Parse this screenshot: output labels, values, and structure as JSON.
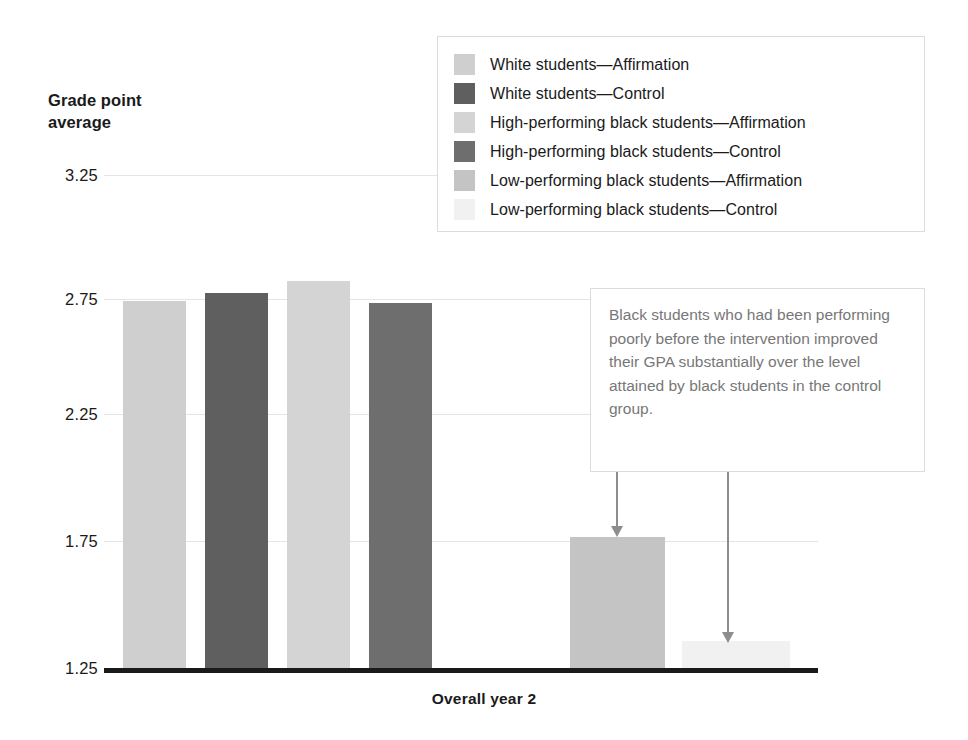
{
  "chart_data": {
    "type": "bar",
    "title": "",
    "ylabel": "Grade point average",
    "xlabel": "Overall year 2",
    "ylim": [
      1.25,
      3.25
    ],
    "yticks": [
      "1.25",
      "1.75",
      "2.25",
      "2.75",
      "3.25"
    ],
    "ytick_values": [
      1.25,
      1.75,
      2.25,
      2.75,
      3.25
    ],
    "grid": true,
    "legend_position": "top-right",
    "categories": [
      "White students—Affirmation",
      "White students—Control",
      "High-performing black students—Affirmation",
      "High-performing black students—Control",
      "Low-performing black students—Affirmation",
      "Low-performing black students—Control"
    ],
    "values": [
      2.74,
      2.77,
      2.82,
      2.73,
      1.78,
      1.36
    ],
    "colors": [
      "#cfcfcf",
      "#5f5f5f",
      "#d4d4d4",
      "#6e6e6e",
      "#c4c4c4",
      "#f1f1f1"
    ],
    "annotations": [
      {
        "text": "Black students who had been performing poorly before the intervention improved their GPA substantially over the level attained by black students in the control group.",
        "points_to": [
          "Low-performing black students—Affirmation",
          "Low-performing black students—Control"
        ]
      }
    ]
  },
  "axis": {
    "ylabel_line1": "Grade point",
    "ylabel_line2": "average",
    "xlabel": "Overall year 2"
  },
  "legend": {
    "items": [
      {
        "label": "White students—Affirmation",
        "color": "#cfcfcf"
      },
      {
        "label": "White students—Control",
        "color": "#5f5f5f"
      },
      {
        "label": "High-performing black students—Affirmation",
        "color": "#d4d4d4"
      },
      {
        "label": "High-performing black students—Control",
        "color": "#6e6e6e"
      },
      {
        "label": "Low-performing black students—Affirmation",
        "color": "#c4c4c4"
      },
      {
        "label": "Low-performing black students—Control",
        "color": "#f1f1f1"
      }
    ]
  },
  "annotation": {
    "text": "Black students who had been performing poorly before the intervention improved their GPA substantially over the level attained by black students in the control group."
  },
  "yticks": [
    {
      "label": "3.25"
    },
    {
      "label": "2.75"
    },
    {
      "label": "2.25"
    },
    {
      "label": "1.75"
    },
    {
      "label": "1.25"
    }
  ]
}
